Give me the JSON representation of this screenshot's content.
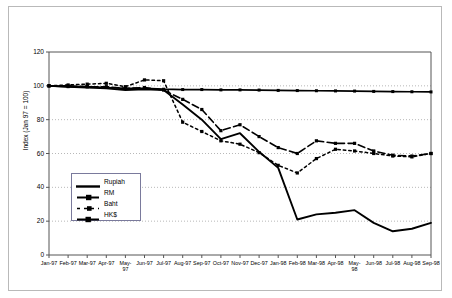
{
  "chart_data": {
    "type": "line",
    "title": "",
    "xlabel": "",
    "ylabel": "Index (Jan 97 = 100)",
    "ylim": [
      0,
      120
    ],
    "yticks": [
      0,
      20,
      40,
      60,
      80,
      100,
      120
    ],
    "grid": true,
    "grid_style": "dotted-horizontal",
    "legend_position": "inner-left-lower",
    "categories": [
      "Jan-97",
      "Feb-97",
      "Mar-97",
      "Apr-97",
      "May-97",
      "Jun-97",
      "Jul-97",
      "Aug-97",
      "Sep-97",
      "Oct-97",
      "Nov-97",
      "Dec-97",
      "Jan-98",
      "Feb-98",
      "Mar-98",
      "Apr-98",
      "May-98",
      "Jun-98",
      "Jul-98",
      "Aug-98",
      "Sep-98"
    ],
    "series": [
      {
        "name": "Rupiah",
        "style": "solid",
        "marker": "none",
        "values": [
          100,
          99.5,
          99,
          98.5,
          97.5,
          98,
          97.5,
          89,
          80,
          68.5,
          72,
          61,
          51.5,
          21,
          24,
          25,
          26.5,
          19,
          14,
          15.5,
          19
        ]
      },
      {
        "name": "RM",
        "style": "long-dash",
        "marker": "square",
        "values": [
          100,
          100,
          99.5,
          99.5,
          98.5,
          99,
          97.5,
          92,
          86,
          73.5,
          77,
          70,
          63.5,
          60,
          67.5,
          66,
          66,
          61.5,
          59,
          58.5,
          60
        ]
      },
      {
        "name": "Baht",
        "style": "short-dash",
        "marker": "square",
        "values": [
          100,
          100.5,
          101,
          101.5,
          99.5,
          103.5,
          103,
          78.5,
          73,
          67.5,
          65.5,
          60.5,
          53,
          48.5,
          57,
          62.5,
          61.5,
          60,
          58.5,
          58,
          60
        ]
      },
      {
        "name": "HK$",
        "style": "solid",
        "marker": "square",
        "values": [
          100,
          99.5,
          99.5,
          99,
          98.5,
          98.5,
          98,
          97.8,
          97.8,
          97.6,
          97.6,
          97.5,
          97.3,
          97.2,
          97.1,
          97,
          96.9,
          96.7,
          96.6,
          96.5,
          96.4
        ]
      }
    ]
  },
  "legend": {
    "items": [
      {
        "label": "Rupiah"
      },
      {
        "label": "RM"
      },
      {
        "label": "Baht"
      },
      {
        "label": "HK$"
      }
    ]
  },
  "colors": {
    "series": "#000000",
    "axis": "#555555",
    "grid": "#999999",
    "frame": "#b9b9b9",
    "legend_border": "#7a7a9c"
  }
}
